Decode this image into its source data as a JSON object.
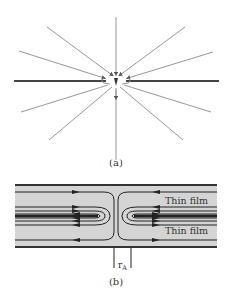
{
  "figure_a": {
    "caption": "(a)",
    "colors": {
      "field_line": "#8a8a8a",
      "film": "#444444",
      "arrow": "#555555"
    }
  },
  "figure_b": {
    "caption": "(b)",
    "labels": {
      "upper_film": "Thin film",
      "lower_film": "Thin film",
      "radius": "r",
      "radius_subscript": "A"
    },
    "colors": {
      "background": "#d4d4d4",
      "line": "#222222",
      "border": "#333333"
    }
  }
}
